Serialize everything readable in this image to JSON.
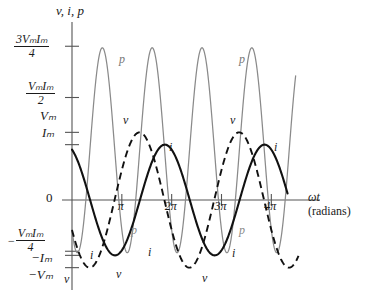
{
  "figure": {
    "kind": "ac-power-waveform-plot",
    "axes": {
      "y_title": "v, i, p",
      "x_title_line1": "ωt",
      "x_title_line2": "(radians)",
      "zero_label": "0"
    },
    "y_ticks": [
      {
        "id": "t_3vi4",
        "value": 0.75,
        "numerator": "3VₘIₘ",
        "denominator": "4",
        "kind": "fraction"
      },
      {
        "id": "t_vi2",
        "value": 0.5,
        "numerator": "VₘIₘ",
        "denominator": "2",
        "kind": "fraction"
      },
      {
        "id": "t_vm",
        "value": 0.33,
        "text": "Vₘ",
        "kind": "plain"
      },
      {
        "id": "t_im",
        "value": 0.27,
        "text": "Iₘ",
        "kind": "plain"
      },
      {
        "id": "t_zero",
        "value": 0.0,
        "text": "0",
        "kind": "plain"
      },
      {
        "id": "t_nvi4",
        "value": -0.25,
        "numerator": "VₘIₘ",
        "denominator": "4",
        "sign": "−",
        "kind": "fraction"
      },
      {
        "id": "t_nim",
        "value": -0.27,
        "text": "−Iₘ",
        "kind": "plain"
      },
      {
        "id": "t_nvm",
        "value": -0.33,
        "text": "−Vₘ",
        "kind": "plain"
      }
    ],
    "x_ticks": [
      {
        "label": "π",
        "value": 3.14159
      },
      {
        "label": "2π",
        "value": 6.28319
      },
      {
        "label": "3π",
        "value": 9.42478
      },
      {
        "label": "4π",
        "value": 12.56637
      }
    ],
    "curve_labels": {
      "p": "p",
      "v": "v",
      "i": "i"
    },
    "colors": {
      "power": "#8a8a8a",
      "voltage": "#111111",
      "current": "#111111",
      "axis": "#555555",
      "background": "#ffffff"
    }
  },
  "chart_data": {
    "type": "line",
    "title": "",
    "xlabel": "ωt (radians)",
    "ylabel": "v, i, p",
    "xlim": [
      0,
      14.5
    ],
    "ylim": [
      -0.38,
      0.82
    ],
    "grid": false,
    "legend": "inline-curve-labels",
    "x_tick_values": [
      3.14159,
      6.28319,
      9.42478,
      12.56637
    ],
    "x_tick_labels": [
      "π",
      "2π",
      "3π",
      "4π"
    ],
    "y_tick_values": [
      0.75,
      0.5,
      0.33,
      0.27,
      0,
      -0.25,
      -0.27,
      -0.33
    ],
    "y_tick_labels": [
      "3VmIm/4",
      "VmIm/2",
      "Vm",
      "Im",
      "0",
      "-VmIm/4",
      "-Im",
      "-Vm"
    ],
    "annotations": [
      {
        "text": "p",
        "meaning": "instantaneous power"
      },
      {
        "text": "v",
        "meaning": "voltage"
      },
      {
        "text": "i",
        "meaning": "current"
      }
    ],
    "series": [
      {
        "name": "p",
        "label": "p",
        "style": "thin-gray-solid",
        "formula": "p = (VmIm/4) + (VmIm/2)*cos(wt) - (VmIm/2)*cos(2*wt + phi)",
        "amplitude_peak": 0.75,
        "amplitude_trough": -0.25,
        "mean": 0.25,
        "period": 3.14159
      },
      {
        "name": "v",
        "label": "v",
        "style": "black-dashed",
        "formula": "v = Vm*sin(wt + 3.6)",
        "amplitude": 0.33,
        "phase_rad": 3.6,
        "period": 6.28319
      },
      {
        "name": "i",
        "label": "i",
        "style": "black-bold-solid",
        "formula": "i = Im*sin(wt + 2.0)",
        "amplitude": 0.27,
        "phase_rad": 2.0,
        "period": 6.28319
      }
    ]
  }
}
